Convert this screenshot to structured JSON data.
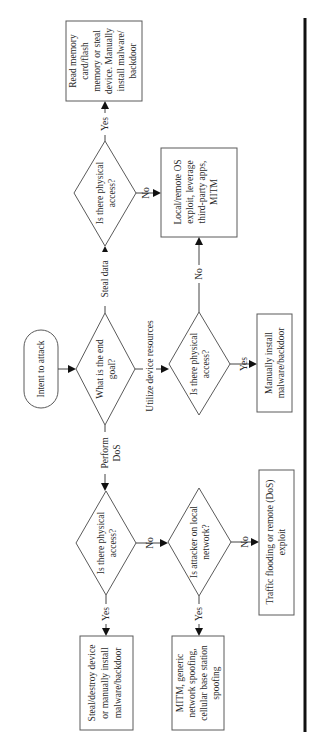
{
  "diagram": {
    "orientation": "rotated-90-ccw",
    "start": {
      "label": "Intent to attack"
    },
    "decisions": {
      "end_goal": {
        "lines": [
          "What is the end",
          "goal?"
        ]
      },
      "steal_physical": {
        "lines": [
          "Is there physical",
          "access?"
        ]
      },
      "utilize_physical": {
        "lines": [
          "Is there physical",
          "access?"
        ]
      },
      "dos_physical": {
        "lines": [
          "Is there physical",
          "access?"
        ]
      },
      "local_network": {
        "lines": [
          "Is attacker on local",
          "network?"
        ]
      }
    },
    "outcomes": {
      "read_memory": {
        "lines": [
          "Read memory",
          "card/flash",
          "memory or steal",
          "device. Manually",
          "install malware/",
          "backdoor"
        ]
      },
      "remote_exploit": {
        "lines": [
          "Local/remote OS",
          "exploit, leverage",
          "third-party apps,",
          "MITM"
        ]
      },
      "manual_install": {
        "lines": [
          "Manually install",
          "malware/backdoor"
        ]
      },
      "steal_destroy": {
        "lines": [
          "Steal/destroy device",
          "or manually install",
          "malware/backdoor"
        ]
      },
      "mitm_spoofing": {
        "lines": [
          "MITM, generic",
          "network spoofing,",
          "cellular base station",
          "spoofing"
        ]
      },
      "traffic_flooding": {
        "lines": [
          "Traffic flooding or remote (DoS)",
          "exploit"
        ]
      }
    },
    "edge_labels": {
      "steal_data": "Steal data",
      "utilize": "Utilize device resources",
      "perform_dos": [
        "Perform",
        "DoS"
      ],
      "yes": "Yes",
      "no": "No"
    }
  }
}
